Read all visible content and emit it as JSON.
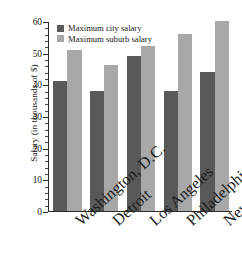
{
  "chart_data": {
    "type": "bar",
    "title": "",
    "xlabel": "",
    "ylabel": "Salary (in thousands of $)",
    "categories": [
      "Washington, D.C.",
      "Detroit",
      "Los Angeles",
      "Philadelphia",
      "New York"
    ],
    "series": [
      {
        "name": "Maximum city salary",
        "color": "#595959",
        "values": [
          41,
          38,
          49,
          38,
          44
        ]
      },
      {
        "name": "Maximum suburb salary",
        "color": "#a8a8a8",
        "values": [
          51,
          46,
          52,
          56,
          60
        ]
      }
    ],
    "ylim": [
      0,
      60
    ],
    "ytick_labels": [
      "0",
      "10",
      "20",
      "30",
      "40",
      "50",
      "60"
    ],
    "ytick_values": [
      0,
      10,
      20,
      30,
      40,
      50,
      60
    ],
    "yminor_step": 2,
    "grid": false,
    "legend_position": "top-left",
    "axis_color": "#2b2b2b",
    "background": "#ffffff"
  }
}
